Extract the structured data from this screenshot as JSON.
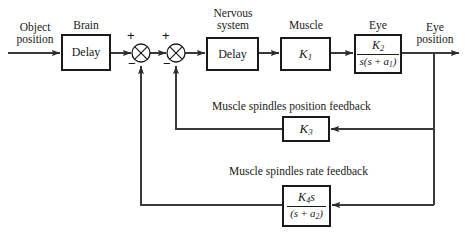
{
  "diagram": {
    "input_label": "Object\nposition",
    "input_label_line1": "Object",
    "input_label_line2": "position",
    "output_label_line1": "Eye",
    "output_label_line2": "position",
    "colors": {
      "line": "#3a3a3a",
      "box_border": "#1a1a1a",
      "text": "#1a1a1a",
      "background": "#ffffff"
    },
    "blocks": [
      {
        "id": "brain",
        "title": "Brain",
        "content": "Delay",
        "content_type": "text",
        "x": 62,
        "y": 35,
        "w": 48,
        "h": 35
      },
      {
        "id": "nervous-system",
        "title_line1": "Nervous",
        "title_line2": "system",
        "title": "Nervous system",
        "content": "Delay",
        "content_type": "text",
        "x": 207,
        "y": 38,
        "w": 51,
        "h": 32
      },
      {
        "id": "muscle",
        "title": "Muscle",
        "content": "K1",
        "content_type": "gain",
        "gain_symbol": "K",
        "gain_subscript": "1",
        "x": 281,
        "y": 38,
        "w": 49,
        "h": 32
      },
      {
        "id": "eye",
        "title": "Eye",
        "content": "K2 / (s(s + a1))",
        "content_type": "fraction",
        "numerator": "K2",
        "denominator": "s(s + a1)",
        "x": 355,
        "y": 35,
        "w": 46,
        "h": 38
      },
      {
        "id": "position-feedback-gain",
        "title": "",
        "content": "K3",
        "content_type": "gain",
        "gain_symbol": "K",
        "gain_subscript": "3",
        "x": 283,
        "y": 117,
        "w": 46,
        "h": 24
      },
      {
        "id": "rate-feedback-gain",
        "title": "",
        "content": "K4s / (s + a2)",
        "content_type": "fraction",
        "numerator": "K4s",
        "denominator": "(s + a2)",
        "x": 283,
        "y": 186,
        "w": 47,
        "h": 40
      }
    ],
    "summing_junctions": [
      {
        "id": "summer-1",
        "cx": 141,
        "cy": 53,
        "r": 9,
        "input_sign": "+",
        "feedback_sign": "−"
      },
      {
        "id": "summer-2",
        "cx": 176,
        "cy": 53,
        "r": 9,
        "input_sign": "+",
        "feedback_sign": "−"
      }
    ],
    "feedback_labels": [
      {
        "id": "position-feedback-label",
        "text": "Muscle spindles position feedback",
        "x": 212,
        "y": 101
      },
      {
        "id": "rate-feedback-label",
        "text": "Muscle spindles rate feedback",
        "x": 229,
        "y": 166
      }
    ]
  }
}
